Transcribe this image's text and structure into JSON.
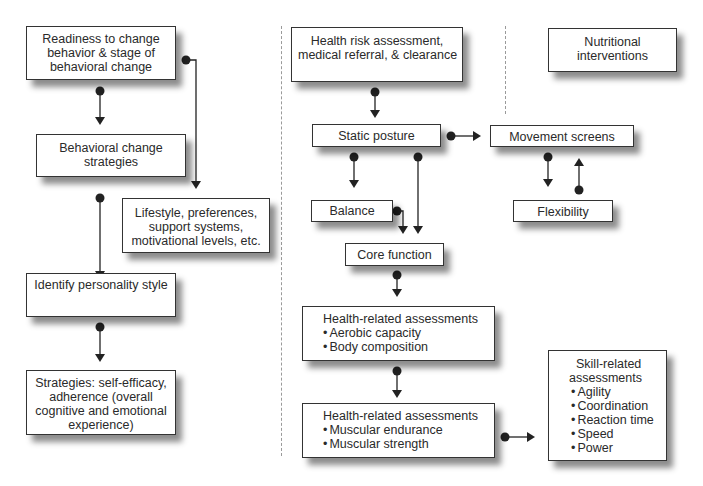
{
  "diagram": {
    "left_column": {
      "readiness": {
        "lines": [
          "Readiness to change",
          "behavior & stage of",
          "behavioral change"
        ]
      },
      "behavioral_strategies": {
        "lines": [
          "Behavioral change",
          "strategies"
        ]
      },
      "lifestyle": {
        "lines": [
          "Lifestyle, preferences,",
          "support systems,",
          "motivational levels, etc."
        ]
      },
      "personality": {
        "lines": [
          "Identify personality style"
        ]
      },
      "strategies": {
        "lines": [
          "Strategies: self-efficacy,",
          "adherence (overall",
          "cognitive and emotional",
          "experience)"
        ]
      }
    },
    "middle_column": {
      "health_risk": {
        "lines": [
          "Health risk assessment,",
          "medical referral, & clearance"
        ]
      },
      "static_posture": {
        "label": "Static posture"
      },
      "balance": {
        "label": "Balance"
      },
      "core_function": {
        "label": "Core function"
      },
      "health_related_1": {
        "title": "Health-related assessments",
        "items": [
          "Aerobic capacity",
          "Body composition"
        ]
      },
      "health_related_2": {
        "title": "Health-related assessments",
        "items": [
          "Muscular endurance",
          "Muscular strength"
        ]
      }
    },
    "right_column": {
      "nutritional": {
        "lines": [
          "Nutritional",
          "interventions"
        ]
      },
      "movement_screens": {
        "label": "Movement screens"
      },
      "flexibility": {
        "label": "Flexibility"
      },
      "skill_related": {
        "title_lines": [
          "Skill-related",
          "assessments"
        ],
        "items": [
          "Agility",
          "Coordination",
          "Reaction time",
          "Speed",
          "Power"
        ]
      }
    }
  }
}
